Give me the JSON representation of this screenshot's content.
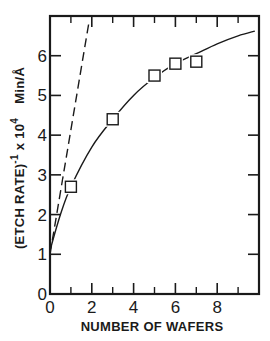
{
  "chart_data": {
    "type": "line",
    "title": "",
    "xlabel": "NUMBER OF WAFERS",
    "ylabel": "(ETCH RATE)⁻¹ × 10⁴  Min/Å",
    "ylabel_parts": {
      "main": "(ETCH RATE)",
      "exp": "-1",
      "mult": "x 10",
      "mult_exp": "4",
      "unit": "Min/Å"
    },
    "xlim": [
      0,
      10
    ],
    "ylim": [
      0,
      7
    ],
    "x_ticks": [
      0,
      2,
      4,
      6,
      8
    ],
    "x_minor_ticks": [
      1,
      3,
      5,
      7,
      9
    ],
    "y_ticks": [
      0,
      1,
      2,
      3,
      4,
      5,
      6
    ],
    "grid": false,
    "legend": null,
    "series": [
      {
        "name": "measured",
        "style": "markers",
        "marker": "open-square",
        "points": [
          {
            "x": 1,
            "y": 2.7
          },
          {
            "x": 3,
            "y": 4.4
          },
          {
            "x": 5,
            "y": 5.5
          },
          {
            "x": 6,
            "y": 5.8
          },
          {
            "x": 7,
            "y": 5.85
          }
        ]
      },
      {
        "name": "fitted curve",
        "style": "solid",
        "points": [
          {
            "x": 0,
            "y": 1.1
          },
          {
            "x": 0.5,
            "y": 2.0
          },
          {
            "x": 1,
            "y": 2.7
          },
          {
            "x": 2,
            "y": 3.7
          },
          {
            "x": 3,
            "y": 4.4
          },
          {
            "x": 4,
            "y": 5.0
          },
          {
            "x": 5,
            "y": 5.45
          },
          {
            "x": 6,
            "y": 5.8
          },
          {
            "x": 7,
            "y": 6.05
          },
          {
            "x": 8,
            "y": 6.3
          },
          {
            "x": 9,
            "y": 6.5
          },
          {
            "x": 9.8,
            "y": 6.62
          }
        ]
      },
      {
        "name": "initial slope",
        "style": "dashed",
        "points": [
          {
            "x": 0,
            "y": 1.0
          },
          {
            "x": 1.85,
            "y": 6.8
          }
        ]
      }
    ]
  }
}
